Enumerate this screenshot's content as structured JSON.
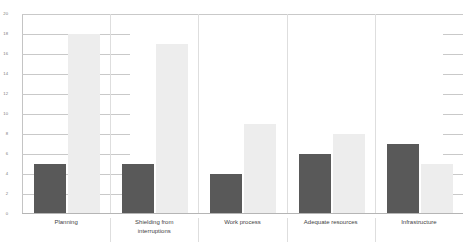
{
  "chart_data": {
    "type": "bar",
    "title": "",
    "subtitle": "",
    "xlabel": "",
    "ylabel": "",
    "ylim": [
      0,
      20
    ],
    "yticks": [
      0,
      2,
      4,
      6,
      8,
      10,
      12,
      14,
      16,
      18,
      20
    ],
    "ytick_labels": [
      "0",
      "2",
      "4",
      "6",
      "8",
      "10",
      "12",
      "14",
      "16",
      "18",
      "20"
    ],
    "grid": true,
    "legend": false,
    "legend_position": "none",
    "categories": [
      "Planning",
      "Shielding from\ninterruptions",
      "Work process",
      "Adequate resources",
      "Infrastructure"
    ],
    "series": [
      {
        "name": "series-a",
        "color": "#595959",
        "values": [
          5,
          5,
          4,
          6,
          7
        ]
      },
      {
        "name": "series-b",
        "color": "#ededed",
        "values": [
          18,
          17,
          9,
          8,
          5
        ]
      }
    ]
  },
  "axis": {
    "gridline_color": "#c9c9c9",
    "baseline_color": "#b5b5b5",
    "separator_color": "#dedede",
    "tick_label_color": "#7a7a7a"
  },
  "background": "#ffffff"
}
